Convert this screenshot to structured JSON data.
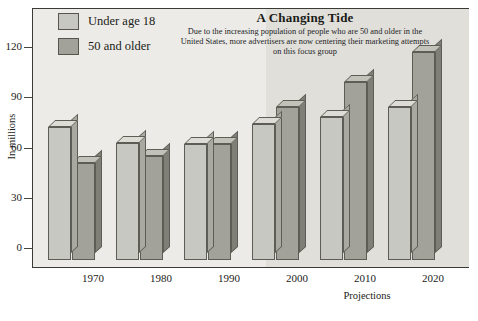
{
  "chart_data": {
    "type": "bar",
    "title": "A Changing Tide",
    "subtitle": "Due to the increasing population of people who are 50 and older in the United States, more advertisers are now centering their marketing attempts on this focus group",
    "xlabel": "Projections",
    "ylabel": "In millions",
    "categories": [
      "1970",
      "1980",
      "1990",
      "2000",
      "2010",
      "2020"
    ],
    "ylim": [
      0,
      128
    ],
    "yticks": [
      0,
      30,
      60,
      90,
      120
    ],
    "ytick_labels": [
      "0",
      "30",
      "60",
      "90",
      "120"
    ],
    "grid": false,
    "legend_position": "top-left",
    "projection_start_category": "2000",
    "series": [
      {
        "name": "Under age 18",
        "color": "#c8c8c2",
        "values": [
          72,
          63,
          62,
          74,
          78,
          84
        ]
      },
      {
        "name": "50 and older",
        "color": "#a2a29a",
        "values": [
          51,
          55,
          62,
          84,
          99,
          117
        ]
      }
    ]
  },
  "legend": {
    "items": [
      {
        "label": "Under age 18"
      },
      {
        "label": "50 and older"
      }
    ]
  },
  "colors": {
    "plot_background": "#ecebe7",
    "projection_background": "#e0dfda",
    "frame": "#3a3a36",
    "series_light": "#c8c8c2",
    "series_dark": "#a2a29a"
  }
}
